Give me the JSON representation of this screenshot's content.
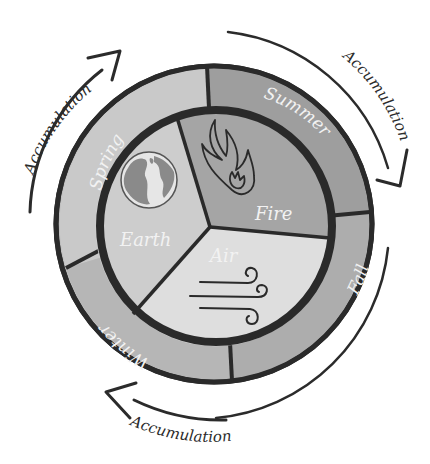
{
  "diagram": {
    "seasons": [
      {
        "label": "Spring",
        "color": "#c9c9c9"
      },
      {
        "label": "Summer",
        "color": "#9a9a9a"
      },
      {
        "label": "Fall",
        "color": "#adadad"
      },
      {
        "label": "Winter",
        "color": "#b8b8b8"
      }
    ],
    "elements": [
      {
        "label": "Earth",
        "icon": "globe-icon",
        "color": "#cfcfcf"
      },
      {
        "label": "Fire",
        "icon": "flame-icon",
        "color": "#a5a5a5"
      },
      {
        "label": "Air",
        "icon": "wind-icon",
        "color": "#dcdcdc"
      }
    ],
    "arrows": [
      {
        "label": "Accumulation",
        "position": "top-left"
      },
      {
        "label": "Accumulation",
        "position": "top-right"
      },
      {
        "label": "Accumulation",
        "position": "bottom"
      }
    ],
    "colors": {
      "outline": "#2a2a2a",
      "label_text": "#f2f2f2",
      "arrow": "#2b2b2b"
    }
  }
}
